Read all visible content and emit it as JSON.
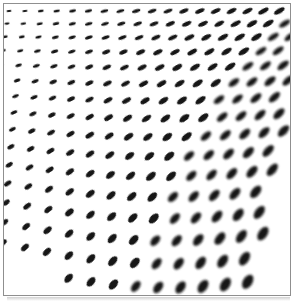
{
  "artwork": {
    "description": "Op-art style warped halftone: a grid of black elliptical dots on white that tilt, enlarge and blur toward the lower right, with curved rows sagging at bottom center, leaving white gaps in the bottom-left and right edges",
    "background_color": "#ffffff",
    "dot_color": "#121212",
    "frame_border_color": "#8f8f8f",
    "frame_shadow_color": "#c2c2c2"
  },
  "frame": {
    "left": 3,
    "top": 3,
    "width": 288,
    "height": 293
  },
  "pattern": {
    "columns": 18,
    "rows": 16,
    "origin_x": 5,
    "origin_y": 7,
    "col_spacing_base": 15.9,
    "col_spacing_gain": 6.5,
    "row_spacing_base": 12.3,
    "row_spacing_accel": 0.24,
    "row_stagger": 2.0,
    "sag_max": 38,
    "sag_power": 1.8,
    "sag_edge": 0.07,
    "tilt_base_deg": -6,
    "tilt_x_gain_deg": -24,
    "tilt_y_gain_deg": -36,
    "tilt_min_deg": -70,
    "dot_width_base": 5.2,
    "dot_width_x_gain": 6.8,
    "dot_width_y_gain": 6.6,
    "dot_aspect_base": 0.4,
    "dot_aspect_y_gain": 0.2,
    "blur_levels": [
      0.25,
      0.55,
      0.95,
      1.5
    ],
    "right_bound_x": 287,
    "right_taper_start_y": 60,
    "right_taper_rate": 0.15,
    "bottom_bound_y": 292,
    "bottom_center_x": 172,
    "bottom_curve": 0.0013
  }
}
